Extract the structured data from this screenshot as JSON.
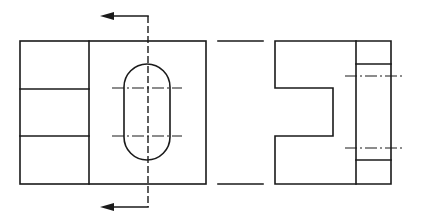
{
  "drawing": {
    "title": "",
    "type": "orthographic-projection",
    "line_color": "#1a1a1a",
    "background": "#ffffff",
    "views": [
      {
        "name": "front-view",
        "outline": {
          "x": 20,
          "y": 41,
          "w": 186,
          "h": 143
        }
      },
      {
        "name": "side-view",
        "outline": {
          "x": 275,
          "y": 41,
          "w": 116,
          "h": 143
        }
      }
    ],
    "section_line": {
      "x": 148,
      "arrow_top_y": 16,
      "arrow_bottom_y": 207,
      "arrow_tip_x": 100
    },
    "slot": {
      "x": 124,
      "y": 64,
      "w": 46,
      "h": 96,
      "radius": 23
    },
    "projection_lines": [
      {
        "y": 41
      },
      {
        "y": 184
      }
    ]
  }
}
